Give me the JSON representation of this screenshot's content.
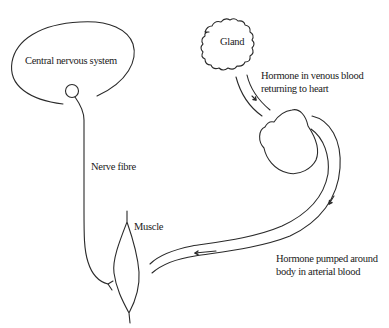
{
  "diagram": {
    "nodes": {
      "cns": {
        "label": "Central nervous system"
      },
      "gland": {
        "label": "Gland"
      },
      "muscle": {
        "label": "Muscle"
      },
      "heart": {
        "label": ""
      }
    },
    "edges": {
      "nerve": {
        "label": "Nerve fibre"
      },
      "venous": {
        "label_line1": "Hormone in venous blood",
        "label_line2": "returning to heart"
      },
      "arterial": {
        "label_line1": "Hormone pumped around",
        "label_line2": "body in arterial blood"
      }
    },
    "colors": {
      "stroke": "#2a2a2a",
      "background": "#ffffff"
    }
  }
}
